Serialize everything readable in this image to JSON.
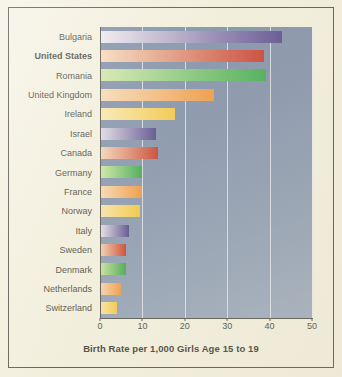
{
  "figure": {
    "background_color": "#f4f1e0",
    "border_color": "#3b3a33",
    "plot_background": "#7183a3"
  },
  "chart_data": {
    "type": "bar",
    "orientation": "horizontal",
    "title": "",
    "xlabel": "Birth Rate per 1,000 Girls Age 15 to 19",
    "ylabel": "",
    "xlim": [
      0,
      50
    ],
    "xticks": [
      0,
      10,
      20,
      30,
      40,
      50
    ],
    "grid": true,
    "legend": "none",
    "highlight_category": "United States",
    "categories": [
      "Bulgaria",
      "United States",
      "Romania",
      "United Kingdom",
      "Ireland",
      "Israel",
      "Canada",
      "Germany",
      "France",
      "Norway",
      "Italy",
      "Sweden",
      "Denmark",
      "Netherlands",
      "Switzerland"
    ],
    "values": [
      43,
      38.7,
      39.2,
      27,
      17.7,
      13.2,
      13.7,
      10,
      10,
      9.5,
      6.9,
      6.2,
      6.2,
      5,
      4
    ],
    "bar_colors_start": [
      "#ede9f2",
      "#f7d7b4",
      "#cfe6a1",
      "#f8d8ae",
      "#fbe6a6",
      "#ddd8e8",
      "#f5d3b2",
      "#c9e59a",
      "#f8d6ae",
      "#fbe3a0",
      "#e6e1ee",
      "#f3cfae",
      "#c5e393",
      "#f7d3ab",
      "#fbe39d"
    ],
    "bar_colors_end": [
      "#3f3084",
      "#c22114",
      "#24a13b",
      "#ef8a2a",
      "#f4c32c",
      "#3b2f7e",
      "#c1240f",
      "#1f9c36",
      "#ef8820",
      "#f2c227",
      "#3c2f80",
      "#c2240f",
      "#1f9a34",
      "#ef8a28",
      "#f3c32c"
    ]
  },
  "axis": {
    "tick_labels": [
      "0",
      "10",
      "20",
      "30",
      "40",
      "50"
    ],
    "title": "Birth Rate per 1,000 Girls Age 15 to 19"
  }
}
